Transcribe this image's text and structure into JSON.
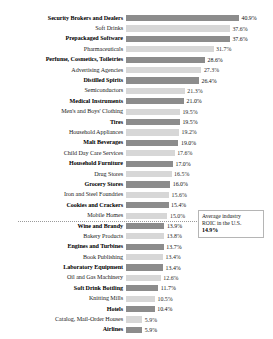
{
  "chart_data": {
    "type": "bar",
    "orientation": "horizontal",
    "title": "",
    "subtitle": "",
    "xlabel": "",
    "ylabel": "",
    "xlim": [
      0,
      40.9
    ],
    "grid": false,
    "legend": null,
    "value_suffix": "%",
    "categories": [
      "Security Brokers and Dealers",
      "Soft Drinks",
      "Prepackaged Software",
      "Pharmaceuticals",
      "Perfume, Cosmetics, Toiletries",
      "Advertising Agencies",
      "Distilled Spirits",
      "Semiconductors",
      "Medical Instruments",
      "Men's and Boys' Clothing",
      "Tires",
      "Household Appliances",
      "Malt Beverages",
      "Child Day Care Services",
      "Household Furniture",
      "Drug Stores",
      "Grocery Stores",
      "Iron and Steel Foundries",
      "Cookies and Crackers",
      "Mobile Homes",
      "Wine and Brandy",
      "Bakery Products",
      "Engines and Turbines",
      "Book Publishing",
      "Laboratory Equipment",
      "Oil and Gas Machinery",
      "Soft Drink Bottling",
      "Knitting Mills",
      "Hotels",
      "Catalog, Mail-Order Houses",
      "Airlines"
    ],
    "values": [
      40.9,
      37.6,
      37.6,
      31.7,
      28.6,
      27.3,
      26.4,
      21.3,
      21.0,
      19.5,
      19.5,
      19.2,
      19.0,
      17.6,
      17.0,
      16.5,
      16.0,
      15.6,
      15.4,
      15.0,
      13.9,
      13.8,
      13.7,
      13.4,
      13.4,
      12.6,
      11.7,
      10.5,
      10.4,
      5.9,
      5.9
    ],
    "value_labels": [
      "40.9%",
      "37.6%",
      "37.6%",
      "31.7%",
      "28.6%",
      "27.3%",
      "26.4%",
      "21.3%",
      "21.0%",
      "19.5%",
      "19.5%",
      "19.2%",
      "19.0%",
      "17.6%",
      "17.0%",
      "16.5%",
      "16.0%",
      "15.6%",
      "15.4%",
      "15.0%",
      "13.9%",
      "13.8%",
      "13.7%",
      "13.4%",
      "13.4%",
      "12.6%",
      "11.7%",
      "10.5%",
      "10.4%",
      "5.9%",
      "5.9%"
    ],
    "annotations": [
      {
        "name": "average-industry-roic",
        "text": "Average industry",
        "text2": "ROIC in the U.S.",
        "value": "14.9%",
        "reference_value": 14.9
      }
    ],
    "colors": {
      "bar_dark": "#8c8c8c",
      "bar_light": "#d7d7d7",
      "reference_line": "#9a9a9a",
      "callout_border": "#b5b5b5",
      "background": "#ffffff"
    }
  }
}
